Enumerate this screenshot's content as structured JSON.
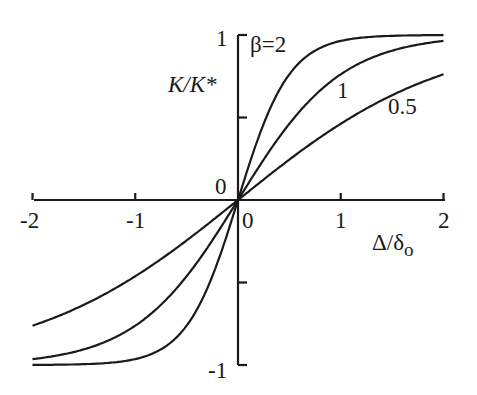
{
  "chart_data": {
    "type": "line",
    "title": "",
    "xlabel": "Δ/δo",
    "ylabel": "K/K*",
    "xlim": [
      -2,
      2
    ],
    "ylim": [
      -1,
      1
    ],
    "x_ticks": [
      "-2",
      "-1",
      "0",
      "1",
      "2"
    ],
    "y_ticks": [
      "-1",
      "0",
      "1"
    ],
    "origin_label": "0",
    "grid": false,
    "legend": "inline labels",
    "function": "K/K* = tanh(β·Δ/δo)",
    "series": [
      {
        "name": "β=2",
        "label": "β=2",
        "beta": 2,
        "x": [
          -2,
          -1.5,
          -1,
          -0.5,
          -0.25,
          0,
          0.25,
          0.5,
          1,
          1.5,
          2
        ],
        "values": [
          -1.0,
          -0.995,
          -0.96,
          -0.76,
          -0.46,
          0,
          0.46,
          0.76,
          0.96,
          0.995,
          1.0
        ]
      },
      {
        "name": "β=1",
        "label": "1",
        "beta": 1,
        "x": [
          -2,
          -1.5,
          -1,
          -0.5,
          -0.25,
          0,
          0.25,
          0.5,
          1,
          1.5,
          2
        ],
        "values": [
          -0.96,
          -0.91,
          -0.76,
          -0.46,
          -0.24,
          0,
          0.24,
          0.46,
          0.76,
          0.91,
          0.96
        ]
      },
      {
        "name": "β=0.5",
        "label": "0.5",
        "beta": 0.5,
        "x": [
          -2,
          -1.5,
          -1,
          -0.5,
          -0.25,
          0,
          0.25,
          0.5,
          1,
          1.5,
          2
        ],
        "values": [
          -0.76,
          -0.64,
          -0.46,
          -0.24,
          -0.12,
          0,
          0.12,
          0.24,
          0.46,
          0.64,
          0.76
        ]
      }
    ]
  },
  "colors": {
    "line": "#1a1a1a",
    "background": "#ffffff"
  }
}
